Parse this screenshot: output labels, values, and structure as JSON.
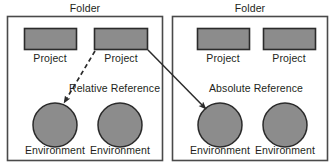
{
  "diagram": {
    "type": "concept-diagram",
    "title_visible": false,
    "background_color": "#ffffff",
    "stroke_color": "#3a3a3a",
    "node_fill_color": "#8c8c8c",
    "text_color": "#231f20",
    "folders": [
      {
        "id": "folder-left",
        "label": "Folder",
        "label_position": "above-top-center",
        "projects": [
          {
            "id": "project-left-1",
            "label": "Project",
            "shape": "rectangle"
          },
          {
            "id": "project-left-2",
            "label": "Project",
            "shape": "rectangle"
          }
        ],
        "environments": [
          {
            "id": "environment-left-1",
            "label": "Environment",
            "shape": "circle"
          },
          {
            "id": "environment-left-2",
            "label": "Environment",
            "shape": "circle"
          }
        ]
      },
      {
        "id": "folder-right",
        "label": "Folder",
        "label_position": "above-top-center",
        "projects": [
          {
            "id": "project-right-1",
            "label": "Project",
            "shape": "rectangle"
          },
          {
            "id": "project-right-2",
            "label": "Project",
            "shape": "rectangle"
          }
        ],
        "environments": [
          {
            "id": "environment-right-1",
            "label": "Environment",
            "shape": "circle"
          },
          {
            "id": "environment-right-2",
            "label": "Environment",
            "shape": "circle"
          }
        ]
      }
    ],
    "connectors": [
      {
        "id": "relative-reference-arrow",
        "label": "Relative Reference",
        "style": "dashed",
        "arrowhead": "end",
        "from": "project-left-2",
        "to": "environment-left-1",
        "description": "dashed arrow from second project in left folder down-left to first environment in left folder"
      },
      {
        "id": "absolute-reference-arrow",
        "label": "Absolute Reference",
        "style": "solid",
        "arrowhead": "end",
        "from": "project-left-2",
        "to": "environment-right-1",
        "description": "solid arrow from second project in left folder across to first environment in right folder"
      }
    ]
  }
}
